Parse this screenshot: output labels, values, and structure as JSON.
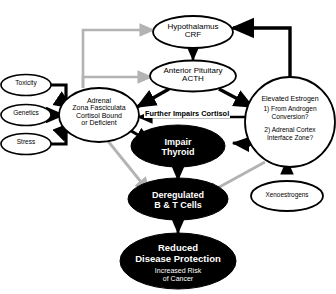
{
  "diagram": {
    "colors": {
      "stroke_black": "#000000",
      "stroke_grey": "#b3b3b3",
      "fill_white": "#ffffff",
      "fill_black": "#000000",
      "text_white": "#ffffff",
      "text_black": "#000000"
    },
    "nodes": [
      {
        "id": "toxicity",
        "label": "Toxicity",
        "shape": "ellipse",
        "fill": "white"
      },
      {
        "id": "genetics",
        "label": "Genetics",
        "shape": "ellipse",
        "fill": "white"
      },
      {
        "id": "stress",
        "label": "Stress",
        "shape": "ellipse",
        "fill": "white"
      },
      {
        "id": "hypothalamus",
        "label": "Hypothalamus\nCRF",
        "shape": "ellipse",
        "fill": "white"
      },
      {
        "id": "pituitary",
        "label": "Anterior Pituitary\nACTH",
        "shape": "ellipse",
        "fill": "white"
      },
      {
        "id": "adrenal",
        "label": "Adrenal\nZona Fasciculata\nCortisol Bound\nor Deficient",
        "shape": "ellipse",
        "fill": "white"
      },
      {
        "id": "estrogen",
        "label": "Elevated Estrogen",
        "shape": "circle",
        "fill": "white",
        "sublines": [
          "1) From Androgen",
          "Conversion?",
          "2) Adrenal Cortex",
          "Interface Zone?"
        ]
      },
      {
        "id": "thyroid",
        "label": "Impair\nThyroid",
        "shape": "ellipse",
        "fill": "black"
      },
      {
        "id": "btcells",
        "label": "Deregulated\nB & T Cells",
        "shape": "ellipse",
        "fill": "black"
      },
      {
        "id": "xenoestrogens",
        "label": "Xenoestrogens",
        "shape": "ellipse",
        "fill": "white"
      },
      {
        "id": "reduced",
        "label": "Reduced\nDisease Protection",
        "sub": "Increased Risk\nof Cancer",
        "shape": "ellipse",
        "fill": "black"
      }
    ],
    "edges": [
      {
        "from": "toxicity",
        "to": "adrenal",
        "color": "black"
      },
      {
        "from": "genetics",
        "to": "adrenal",
        "color": "black"
      },
      {
        "from": "stress",
        "to": "adrenal",
        "color": "black"
      },
      {
        "from": "hypothalamus",
        "to": "pituitary",
        "color": "black"
      },
      {
        "from": "pituitary",
        "to": "adrenal",
        "color": "black"
      },
      {
        "from": "pituitary",
        "to": "estrogen",
        "color": "black"
      },
      {
        "from": "adrenal",
        "to": "hypothalamus",
        "color": "grey"
      },
      {
        "from": "adrenal",
        "to": "pituitary",
        "color": "grey"
      },
      {
        "from": "adrenal",
        "to": "thyroid",
        "color": "black"
      },
      {
        "from": "adrenal",
        "to": "btcells",
        "color": "grey"
      },
      {
        "from": "estrogen",
        "to": "hypothalamus",
        "color": "black"
      },
      {
        "from": "estrogen",
        "to": "adrenal",
        "color": "black",
        "label": "Further Impairs Cortisol"
      },
      {
        "from": "estrogen",
        "to": "thyroid",
        "color": "black"
      },
      {
        "from": "estrogen",
        "to": "btcells",
        "color": "grey"
      },
      {
        "from": "xenoestrogens",
        "to": "estrogen",
        "color": "black"
      },
      {
        "from": "thyroid",
        "to": "btcells",
        "color": "black"
      },
      {
        "from": "btcells",
        "to": "reduced",
        "color": "black"
      }
    ],
    "edge_labels": {
      "further_impairs_cortisol": "Further Impairs Cortisol"
    }
  }
}
